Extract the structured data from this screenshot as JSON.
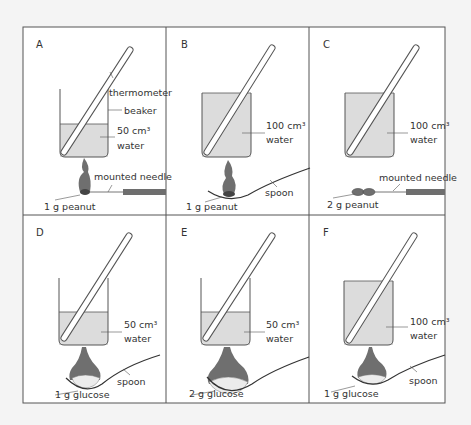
{
  "figure": {
    "background": "#f4f4f4",
    "panel_background": "#ffffff",
    "border_color": "#555555",
    "water_color": "#dcdcdc",
    "flame_color": "#6f6f6f",
    "needle_color": "#6e6e6e"
  },
  "labels": {
    "thermometer": "thermometer",
    "beaker": "beaker",
    "mounted_needle": "mounted needle",
    "spoon": "spoon",
    "water": "water",
    "cm3_50": "50 cm³",
    "cm3_100": "100 cm³"
  },
  "panels": [
    {
      "id": "A",
      "letter": "A",
      "volume": "50 cm³",
      "water": "water",
      "fuel": "1 g peanut",
      "holder": "mounted needle",
      "extra_labels": [
        "thermometer",
        "beaker"
      ]
    },
    {
      "id": "B",
      "letter": "B",
      "volume": "100 cm³",
      "water": "water",
      "fuel": "1 g peanut",
      "holder": "spoon"
    },
    {
      "id": "C",
      "letter": "C",
      "volume": "100 cm³",
      "water": "water",
      "fuel": "2 g peanut",
      "holder": "mounted needle"
    },
    {
      "id": "D",
      "letter": "D",
      "volume": "50 cm³",
      "water": "water",
      "fuel": "1 g glucose",
      "holder": "spoon"
    },
    {
      "id": "E",
      "letter": "E",
      "volume": "50 cm³",
      "water": "water",
      "fuel": "2 g glucose",
      "holder": "spoon"
    },
    {
      "id": "F",
      "letter": "F",
      "volume": "100 cm³",
      "water": "water",
      "fuel": "1 g glucose",
      "holder": "spoon"
    }
  ]
}
